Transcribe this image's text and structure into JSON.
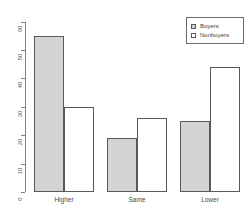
{
  "chart_data": {
    "type": "bar",
    "title": "",
    "xlabel": "",
    "ylabel": "",
    "categories": [
      "Higher",
      "Same",
      "Lower"
    ],
    "series": [
      {
        "name": "Buyers",
        "values": [
          55,
          19,
          25
        ],
        "color": "#d4d4d4"
      },
      {
        "name": "Nonbuyers",
        "values": [
          30,
          26,
          44
        ],
        "color": "#ffffff"
      }
    ],
    "ylim": [
      0,
      60
    ],
    "yticks": [
      0,
      10,
      20,
      30,
      40,
      50,
      60
    ],
    "ytick_labels": [
      "0",
      "10",
      "20",
      "30",
      "40",
      "50",
      "60"
    ],
    "grid": false,
    "legend_position": "top-right"
  },
  "axis": {
    "ticks": [
      {
        "label": "60",
        "value": 60
      },
      {
        "label": "50",
        "value": 50
      },
      {
        "label": "40",
        "value": 40
      },
      {
        "label": "30",
        "value": 30
      },
      {
        "label": "20",
        "value": 20
      },
      {
        "label": "10",
        "value": 10
      },
      {
        "label": "0",
        "value": 0
      }
    ]
  },
  "categories": [
    {
      "label": "Higher"
    },
    {
      "label": "Same"
    },
    {
      "label": "Lower"
    }
  ],
  "legend": {
    "entries": [
      {
        "label": "Buyers",
        "swatch": "filled-square-icon"
      },
      {
        "label": "Nonbuyers",
        "swatch": "empty-square-icon"
      }
    ]
  }
}
